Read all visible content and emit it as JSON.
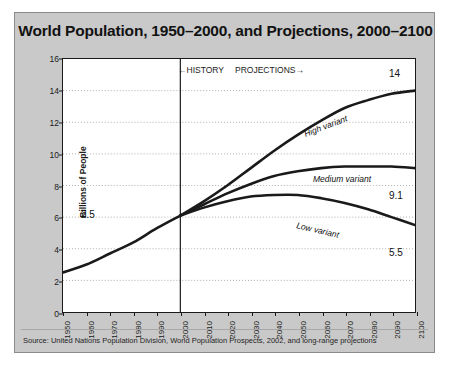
{
  "figure": {
    "title": "World Population, 1950–2000, and Projections, 2000–2100",
    "source": "Source: United Nations Population Division, World Population Prospects, 2002, and long-range projections",
    "background_color": "#c9c9c9",
    "plot_background_color": "#ffffff",
    "axis_color": "#1a1a1a",
    "grid_color": "#9a9a9a",
    "curve_color": "#1a1a1a"
  },
  "annotations": {
    "history": "←HISTORY",
    "projections": "PROJECTIONS→",
    "divider_year": 2000,
    "start_value_label": "2.5",
    "high_label": "High variant",
    "medium_label": "Medium variant",
    "low_label": "Low variant",
    "high_end_label": "14",
    "medium_end_label": "9.1",
    "low_end_label": "5.5"
  },
  "chart_data": {
    "type": "line",
    "title": "World Population, 1950–2000, and Projections, 2000–2100",
    "xlabel": "",
    "ylabel": "Billions of People",
    "xlim": [
      1950,
      2100
    ],
    "ylim": [
      0,
      16
    ],
    "yticks": [
      0,
      2,
      4,
      6,
      8,
      10,
      12,
      14,
      16
    ],
    "xticks": [
      1950,
      1960,
      1970,
      1980,
      1990,
      2000,
      2010,
      2020,
      2030,
      2040,
      2050,
      2060,
      2070,
      2080,
      2090,
      2100
    ],
    "grid": true,
    "legend": "inline-labels",
    "series": [
      {
        "name": "History",
        "x": [
          1950,
          1960,
          1970,
          1980,
          1990,
          2000
        ],
        "values": [
          2.5,
          3.0,
          3.7,
          4.4,
          5.3,
          6.1
        ]
      },
      {
        "name": "High variant",
        "x": [
          2000,
          2010,
          2020,
          2030,
          2040,
          2050,
          2060,
          2070,
          2080,
          2090,
          2100
        ],
        "values": [
          6.1,
          7.0,
          8.0,
          9.1,
          10.2,
          11.2,
          12.1,
          12.9,
          13.4,
          13.8,
          14.0
        ]
      },
      {
        "name": "Medium variant",
        "x": [
          2000,
          2010,
          2020,
          2030,
          2040,
          2050,
          2060,
          2070,
          2080,
          2090,
          2100
        ],
        "values": [
          6.1,
          6.8,
          7.5,
          8.1,
          8.6,
          8.9,
          9.1,
          9.2,
          9.2,
          9.2,
          9.1
        ]
      },
      {
        "name": "Low variant",
        "x": [
          2000,
          2010,
          2020,
          2030,
          2040,
          2050,
          2060,
          2070,
          2080,
          2090,
          2100
        ],
        "values": [
          6.1,
          6.6,
          7.0,
          7.3,
          7.4,
          7.4,
          7.2,
          6.9,
          6.5,
          6.0,
          5.5
        ]
      }
    ]
  }
}
